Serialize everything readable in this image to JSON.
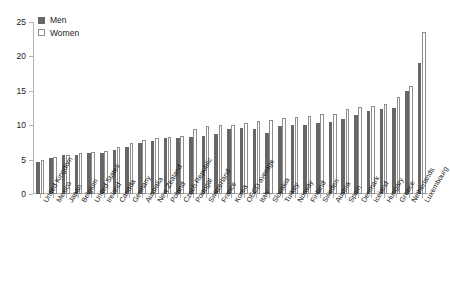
{
  "chart_data": {
    "type": "bar",
    "title": "",
    "subtitle": "",
    "xlabel": "",
    "ylabel": "",
    "ylim": [
      0,
      25
    ],
    "yticks": [
      0,
      5,
      10,
      15,
      20,
      25
    ],
    "grid": false,
    "legend_position": "top-left",
    "categories": [
      "United Kingdom",
      "Mexico",
      "Japan",
      "Belgium",
      "United States",
      "Ireland",
      "Canada",
      "Germany",
      "Australia",
      "New Zealand",
      "Poland",
      "Czech Republic",
      "Portugal",
      "Switzerland",
      "France",
      "Korea",
      "OECD average",
      "Italy",
      "Slovakia",
      "Turkey",
      "Norway",
      "Finland",
      "Sweden",
      "Austria",
      "Spain",
      "Denmark",
      "Iceland",
      "Hungary",
      "Greece",
      "Netherlands",
      "Luxembourg"
    ],
    "series": [
      {
        "name": "Men",
        "color": "#666666",
        "values": [
          4.6,
          5.3,
          5.6,
          5.7,
          5.9,
          6.0,
          6.4,
          6.9,
          7.4,
          7.7,
          8.1,
          8.2,
          8.3,
          8.4,
          8.7,
          9.4,
          9.6,
          9.5,
          8.9,
          9.9,
          10.0,
          10.1,
          10.3,
          10.5,
          10.9,
          11.5,
          12.1,
          12.4,
          12.5,
          15.0,
          19.0
        ]
      },
      {
        "name": "Women",
        "color": "#ffffff",
        "border_color": "#8e8e8e",
        "values": [
          5.0,
          5.4,
          5.6,
          5.9,
          6.1,
          6.3,
          6.9,
          7.4,
          7.9,
          8.2,
          8.3,
          8.5,
          9.5,
          9.9,
          10.0,
          10.1,
          10.3,
          10.6,
          10.8,
          11.0,
          11.2,
          11.3,
          11.6,
          11.6,
          12.4,
          12.6,
          12.8,
          13.1,
          14.1,
          15.7,
          23.5
        ]
      }
    ]
  },
  "legend": {
    "items": [
      {
        "label": "Men",
        "swatch": "men-swatch"
      },
      {
        "label": "Women",
        "swatch": "women-swatch"
      }
    ]
  }
}
